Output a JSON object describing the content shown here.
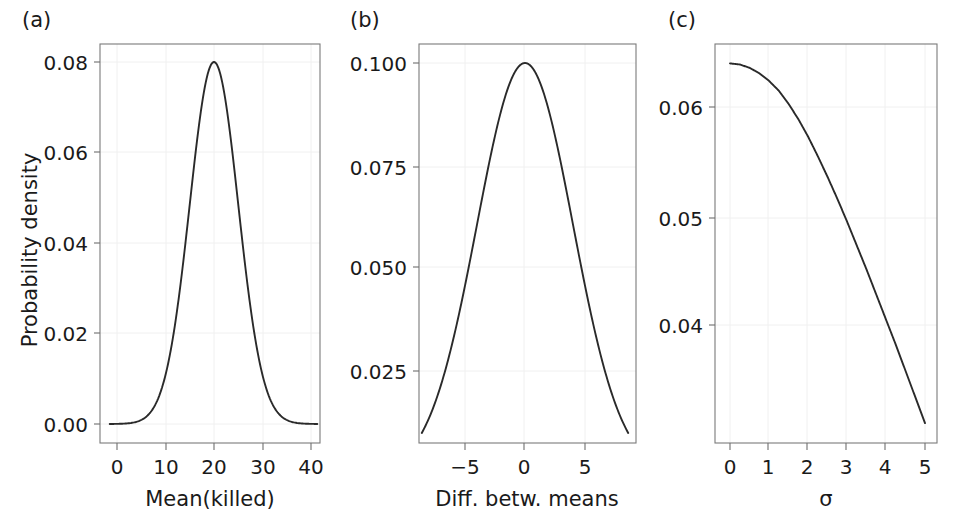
{
  "figure": {
    "background_color": "#ffffff",
    "curve_color": "#2a2a2a",
    "frame_color": "#7a7a7a",
    "grid_color": "#f0f0f0"
  },
  "panels": [
    {
      "label": "(a)",
      "ylabel": "Probability density",
      "xlabel": "Mean(killed)",
      "yticks": [
        "0.00",
        "0.02",
        "0.04",
        "0.06",
        "0.08"
      ],
      "xticks": [
        "0",
        "10",
        "20",
        "30",
        "40"
      ]
    },
    {
      "label": "(b)",
      "ylabel": "",
      "xlabel": "Diff. betw. means",
      "yticks": [
        "0.025",
        "0.050",
        "0.075",
        "0.100"
      ],
      "xticks": [
        "−5",
        "0",
        "5"
      ]
    },
    {
      "label": "(c)",
      "ylabel": "",
      "xlabel": "σ",
      "yticks": [
        "0.04",
        "0.05",
        "0.06"
      ],
      "xticks": [
        "0",
        "1",
        "2",
        "3",
        "4",
        "5"
      ]
    }
  ],
  "chart_data": [
    {
      "type": "line",
      "panel": "(a)",
      "title": "",
      "xlabel": "Mean(killed)",
      "ylabel": "Probability density",
      "xlim": [
        -1.5,
        41.5
      ],
      "ylim": [
        -0.0045,
        0.0845
      ],
      "xticks": [
        0,
        10,
        20,
        30,
        40
      ],
      "yticks": [
        0.0,
        0.02,
        0.04,
        0.06,
        0.08
      ],
      "grid": true,
      "legend": "none",
      "distribution": "normal",
      "mean": 20,
      "sd": 5,
      "peak_value": 0.08,
      "x": [
        0,
        2,
        4,
        6,
        8,
        10,
        12,
        14,
        16,
        18,
        20,
        22,
        24,
        26,
        28,
        30,
        32,
        34,
        36,
        38,
        40
      ],
      "y": [
        0.0,
        0.0,
        0.0002,
        0.0006,
        0.0022,
        0.0068,
        0.0175,
        0.0382,
        0.0705,
        0.1103,
        0.1468,
        0.1103,
        0.0705,
        0.0382,
        0.0175,
        0.0068,
        0.0022,
        0.0006,
        0.0002,
        0.0,
        0.0
      ],
      "y_scaled": [
        0.0,
        0.0,
        0.0001,
        0.0004,
        0.0012,
        0.0037,
        0.0095,
        0.0208,
        0.0384,
        0.0601,
        0.08,
        0.0601,
        0.0384,
        0.0208,
        0.0095,
        0.0037,
        0.0012,
        0.0004,
        0.0001,
        0.0,
        0.0
      ]
    },
    {
      "type": "line",
      "panel": "(b)",
      "title": "",
      "xlabel": "Diff. betw. means",
      "ylabel": "",
      "xlim": [
        -8.9,
        8.9
      ],
      "ylim": [
        0.0095,
        0.1045
      ],
      "xticks": [
        -5,
        0,
        5
      ],
      "yticks": [
        0.025,
        0.05,
        0.075,
        0.1
      ],
      "grid": true,
      "legend": "none",
      "distribution": "normal",
      "mean": 0,
      "sd": 4,
      "peak_value": 0.1,
      "x": [
        -8,
        -7,
        -6,
        -5,
        -4,
        -3,
        -2,
        -1,
        0,
        1,
        2,
        3,
        4,
        5,
        6,
        7,
        8
      ],
      "y_scaled": [
        0.0135,
        0.0216,
        0.0325,
        0.0458,
        0.0607,
        0.0755,
        0.0882,
        0.0969,
        0.1,
        0.0969,
        0.0882,
        0.0755,
        0.0607,
        0.0458,
        0.0325,
        0.0216,
        0.0135
      ]
    },
    {
      "type": "line",
      "panel": "(c)",
      "title": "",
      "xlabel": "σ",
      "ylabel": "",
      "xlim": [
        -0.35,
        5.35
      ],
      "ylim": [
        0.0295,
        0.0665
      ],
      "xticks": [
        0,
        1,
        2,
        3,
        4,
        5
      ],
      "yticks": [
        0.04,
        0.05,
        0.06
      ],
      "grid": true,
      "legend": "none",
      "x": [
        0.0,
        0.25,
        0.5,
        0.75,
        1.0,
        1.25,
        1.5,
        1.75,
        2.0,
        2.25,
        2.5,
        2.75,
        3.0,
        3.25,
        3.5,
        3.75,
        4.0,
        4.25,
        4.5,
        4.75,
        5.0
      ],
      "y": [
        0.064,
        0.0639,
        0.0636,
        0.0631,
        0.0624,
        0.0615,
        0.0603,
        0.0589,
        0.0573,
        0.0555,
        0.0536,
        0.0516,
        0.0495,
        0.0473,
        0.0451,
        0.0428,
        0.0405,
        0.0382,
        0.0358,
        0.0334,
        0.031
      ]
    }
  ]
}
